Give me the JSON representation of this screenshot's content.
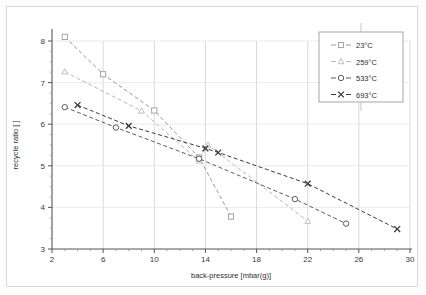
{
  "chart_data": {
    "type": "line",
    "title": "",
    "xlabel": "back-pressure [mbar(g)]",
    "ylabel": "recycle ratio [ ]",
    "xlim": [
      2,
      30
    ],
    "ylim": [
      3,
      8
    ],
    "xticks": [
      2,
      6,
      10,
      14,
      18,
      22,
      26,
      30
    ],
    "yticks": [
      3,
      4,
      5,
      6,
      7,
      8
    ],
    "xtick_labels": [
      "2",
      "6",
      "10",
      "14",
      "18",
      "22",
      "26",
      "30"
    ],
    "ytick_labels": [
      "3",
      "4",
      "5",
      "6",
      "7",
      "8"
    ],
    "minor_ticks": true,
    "grid": true,
    "grid_color": "#c9c9c9",
    "legend_position": "top-right",
    "line_style": "dashed",
    "series": [
      {
        "name": "23°C",
        "marker": "square",
        "color": "#9a9a9a",
        "points": [
          {
            "x": 3.0,
            "y": 8.1
          },
          {
            "x": 6.0,
            "y": 7.2
          },
          {
            "x": 10.0,
            "y": 6.33
          },
          {
            "x": 13.5,
            "y": 5.2
          },
          {
            "x": 16.0,
            "y": 3.78
          }
        ]
      },
      {
        "name": "259°C",
        "marker": "triangle",
        "color": "#b8b8b8",
        "points": [
          {
            "x": 3.0,
            "y": 7.26
          },
          {
            "x": 9.0,
            "y": 6.32
          },
          {
            "x": 13.5,
            "y": 5.12
          },
          {
            "x": 14.2,
            "y": 5.5
          },
          {
            "x": 22.0,
            "y": 3.67
          }
        ]
      },
      {
        "name": "533°C",
        "marker": "circle",
        "color": "#5c5c5c",
        "points": [
          {
            "x": 3.0,
            "y": 6.41
          },
          {
            "x": 7.0,
            "y": 5.92
          },
          {
            "x": 13.5,
            "y": 5.17
          },
          {
            "x": 21.0,
            "y": 4.2
          },
          {
            "x": 25.0,
            "y": 3.61
          }
        ]
      },
      {
        "name": "693°C",
        "marker": "cross",
        "color": "#3a3a3a",
        "points": [
          {
            "x": 4.0,
            "y": 6.46
          },
          {
            "x": 8.0,
            "y": 5.96
          },
          {
            "x": 14.0,
            "y": 5.42
          },
          {
            "x": 15.0,
            "y": 5.32
          },
          {
            "x": 22.0,
            "y": 4.57
          },
          {
            "x": 29.0,
            "y": 3.48
          }
        ]
      }
    ]
  },
  "legend": {
    "entries": [
      {
        "label": "23°C"
      },
      {
        "label": "259°C"
      },
      {
        "label": "533°C"
      },
      {
        "label": "693°C"
      }
    ]
  },
  "axes": {
    "x_title": "back-pressure [mbar(g)]",
    "y_title": "recycle ratio [ ]"
  }
}
